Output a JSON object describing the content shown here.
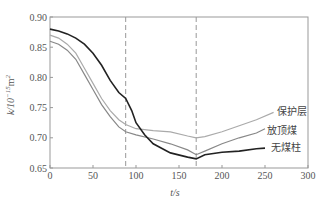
{
  "chart_data": {
    "type": "line",
    "title": "",
    "xlabel": "t/s",
    "ylabel": "k/10^-15 m^2",
    "xlim": [
      0,
      300
    ],
    "ylim": [
      0.65,
      0.9
    ],
    "xticks": [
      0,
      50,
      100,
      150,
      200,
      250,
      300
    ],
    "yticks": [
      0.65,
      0.7,
      0.75,
      0.8,
      0.85,
      0.9
    ],
    "ytick_labels": [
      "0.65",
      "0.70",
      "0.75",
      "0.80",
      "0.85",
      "0.90"
    ],
    "grid": false,
    "vlines": [
      88,
      170
    ],
    "legend_position": "inline-right",
    "series": [
      {
        "name": "保护层",
        "color": "#aaaaaa",
        "x": [
          0,
          10,
          20,
          30,
          40,
          50,
          60,
          70,
          80,
          88,
          100,
          120,
          140,
          160,
          170,
          180,
          200,
          220,
          240,
          260
        ],
        "y": [
          0.87,
          0.865,
          0.855,
          0.84,
          0.815,
          0.79,
          0.765,
          0.745,
          0.73,
          0.722,
          0.715,
          0.712,
          0.71,
          0.703,
          0.7,
          0.702,
          0.71,
          0.72,
          0.73,
          0.742
        ]
      },
      {
        "name": "放顶煤",
        "color": "#888888",
        "x": [
          0,
          10,
          20,
          30,
          40,
          50,
          60,
          70,
          80,
          88,
          100,
          120,
          140,
          160,
          170,
          180,
          200,
          220,
          240,
          250
        ],
        "y": [
          0.86,
          0.855,
          0.845,
          0.83,
          0.805,
          0.78,
          0.755,
          0.735,
          0.718,
          0.71,
          0.705,
          0.698,
          0.69,
          0.68,
          0.672,
          0.678,
          0.69,
          0.7,
          0.708,
          0.715
        ]
      },
      {
        "name": "无煤柱",
        "color": "#222222",
        "x": [
          0,
          10,
          20,
          30,
          40,
          50,
          60,
          70,
          80,
          88,
          95,
          100,
          110,
          120,
          140,
          160,
          170,
          180,
          200,
          220,
          240,
          250
        ],
        "y": [
          0.88,
          0.877,
          0.872,
          0.865,
          0.855,
          0.84,
          0.82,
          0.795,
          0.775,
          0.765,
          0.745,
          0.725,
          0.705,
          0.69,
          0.675,
          0.668,
          0.665,
          0.672,
          0.676,
          0.678,
          0.682,
          0.683
        ]
      }
    ],
    "annotations": [
      {
        "text": "保护层",
        "x": 262,
        "y": 0.742
      },
      {
        "text": "放顶煤",
        "x": 250,
        "y": 0.712
      },
      {
        "text": "无煤柱",
        "x": 255,
        "y": 0.683
      }
    ]
  }
}
